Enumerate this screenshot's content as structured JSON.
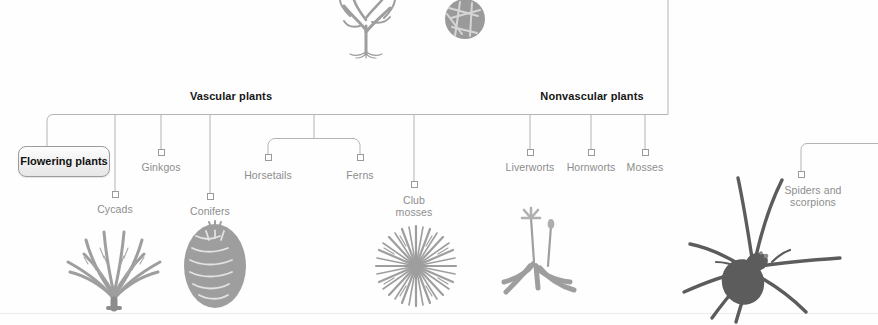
{
  "diagram": {
    "type": "cladogram",
    "colors": {
      "line": "#b4b4b4",
      "label_text": "#8d8d8d",
      "header_text": "#161616",
      "node_stroke": "#9a9a9a",
      "art_gray": "#9e9e9e",
      "art_dark": "#5c5c5c",
      "background": "#ffffff"
    },
    "headers": [
      {
        "label": "Vascular plants",
        "x": 231,
        "y": 90
      },
      {
        "label": "Nonvascular plants",
        "x": 592,
        "y": 90
      }
    ],
    "highlight_box": {
      "label": "Flowering\nplants",
      "x": 18,
      "y": 146,
      "w": 92,
      "h": 31
    },
    "leaves": [
      {
        "name": "cycads",
        "label": "Cycads",
        "x": 115,
        "y": 204,
        "node_y": 194,
        "top_y": 115
      },
      {
        "name": "ginkgos",
        "label": "Ginkgos",
        "x": 161,
        "y": 162,
        "node_y": 152,
        "top_y": 115
      },
      {
        "name": "conifers",
        "label": "Conifers",
        "x": 210,
        "y": 206,
        "node_y": 196,
        "top_y": 115
      },
      {
        "name": "horsetails",
        "label": "Horsetails",
        "x": 268,
        "y": 170,
        "node_y": 157,
        "top_y": 139
      },
      {
        "name": "ferns",
        "label": "Ferns",
        "x": 360,
        "y": 170,
        "node_y": 157,
        "top_y": 139
      },
      {
        "name": "club-mosses",
        "label": "Club\nmosses",
        "x": 414,
        "y": 195,
        "node_y": 184,
        "top_y": 115
      },
      {
        "name": "liverworts",
        "label": "Liverworts",
        "x": 530,
        "y": 162,
        "node_y": 152,
        "top_y": 115
      },
      {
        "name": "hornworts",
        "label": "Hornworts",
        "x": 591,
        "y": 162,
        "node_y": 152,
        "top_y": 115
      },
      {
        "name": "mosses",
        "label": "Mosses",
        "x": 645,
        "y": 162,
        "node_y": 152,
        "top_y": 115
      },
      {
        "name": "spiders-and-scorpions",
        "label": "Spiders and\nscorpions",
        "x": 813,
        "y": 185,
        "node_y": 174,
        "top_y": 153
      }
    ],
    "illustrations": [
      {
        "name": "green-alga-illustration",
        "x": 332,
        "y": 0,
        "w": 70,
        "h": 58
      },
      {
        "name": "diatom-illustration",
        "x": 440,
        "y": 0,
        "w": 50,
        "h": 40
      },
      {
        "name": "cycad-illustration",
        "x": 66,
        "y": 222,
        "w": 96,
        "h": 86
      },
      {
        "name": "conifer-cone-illustration",
        "x": 182,
        "y": 222,
        "w": 66,
        "h": 84
      },
      {
        "name": "club-moss-illustration",
        "x": 370,
        "y": 226,
        "w": 92,
        "h": 80
      },
      {
        "name": "liverwort-illustration",
        "x": 498,
        "y": 196,
        "w": 82,
        "h": 106
      },
      {
        "name": "spider-illustration",
        "x": 688,
        "y": 160,
        "w": 132,
        "h": 148
      }
    ]
  }
}
